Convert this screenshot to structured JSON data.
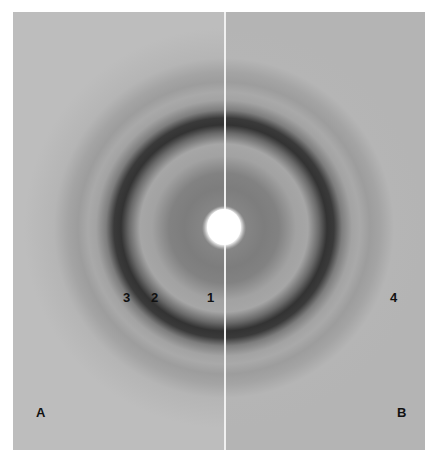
{
  "figure": {
    "ring_labels": [
      {
        "id": "ring-3",
        "text": "3"
      },
      {
        "id": "ring-2",
        "text": "2"
      },
      {
        "id": "ring-1",
        "text": "1"
      },
      {
        "id": "ring-4",
        "text": "4"
      }
    ],
    "panel_labels": {
      "left": "A",
      "right": "B"
    }
  }
}
